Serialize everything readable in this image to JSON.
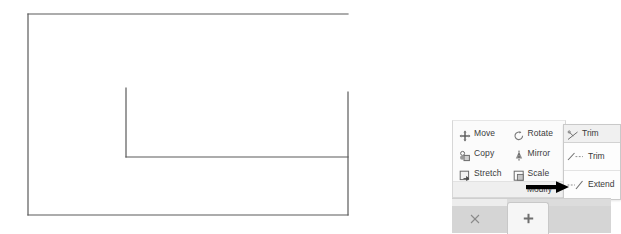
{
  "app": {
    "context": "cad-drawing-editor"
  },
  "drawing": {
    "name": "trimmed-rectangle-sketch",
    "stroke_color": "#5a5a5a",
    "background": "#ffffff",
    "entities": [
      {
        "name": "top-edge",
        "type": "line",
        "x1": 28,
        "y1": 14,
        "x2": 348,
        "y2": 14
      },
      {
        "name": "left-edge",
        "type": "line",
        "x1": 28,
        "y1": 14,
        "x2": 28,
        "y2": 215
      },
      {
        "name": "bottom-edge",
        "type": "line",
        "x1": 28,
        "y1": 215,
        "x2": 348,
        "y2": 215
      },
      {
        "name": "right-edge-partial",
        "type": "line",
        "x1": 348,
        "y1": 92,
        "x2": 348,
        "y2": 215
      },
      {
        "name": "inner-vertical-line",
        "type": "line",
        "x1": 126,
        "y1": 88,
        "x2": 126,
        "y2": 157
      },
      {
        "name": "inner-horizontal-line",
        "type": "line",
        "x1": 126,
        "y1": 157,
        "x2": 348,
        "y2": 157
      }
    ]
  },
  "ribbon": {
    "panel_title": "Modify",
    "buttons_column_left": [
      {
        "label": "Move",
        "icon": "move-icon"
      },
      {
        "label": "Copy",
        "icon": "copy-icon"
      },
      {
        "label": "Stretch",
        "icon": "stretch-icon"
      }
    ],
    "buttons_column_right": [
      {
        "label": "Rotate",
        "icon": "rotate-icon"
      },
      {
        "label": "Mirror",
        "icon": "mirror-icon"
      },
      {
        "label": "Scale",
        "icon": "scale-icon"
      }
    ]
  },
  "flyout": {
    "name": "trim-extend-flyout",
    "header_label": "Trim",
    "header_icon": "trim-icon",
    "items": [
      {
        "label": "Trim",
        "icon": "trim-large-icon"
      },
      {
        "label": "Extend",
        "icon": "extend-large-icon"
      }
    ]
  },
  "annotation": {
    "name": "pointer-arrow",
    "color": "#000000",
    "points_to": "Extend"
  },
  "tabs": {
    "sheet_icon": "new-sheet-plus-icon",
    "close_mark_icon": "model-tab-icon"
  },
  "colors": {
    "panel_background": "#f4f4f4",
    "panel_body": "#fbfbfb",
    "panel_title_bar": "#efefef",
    "flyout_background": "#fdfdfd",
    "text": "#3a3a3a",
    "border": "#d7d7d7",
    "tab_strip": "#dcdcdc"
  }
}
